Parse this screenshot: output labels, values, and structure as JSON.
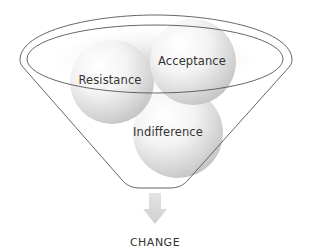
{
  "diagram": {
    "type": "funnel",
    "inputs": [
      {
        "label": "Resistance",
        "position": "left"
      },
      {
        "label": "Acceptance",
        "position": "right"
      },
      {
        "label": "Indifference",
        "position": "bottom"
      }
    ],
    "output": {
      "label": "CHANGE"
    },
    "colors": {
      "outline": "#555555",
      "sphere_light": "#ffffff",
      "sphere_dark": "#c8c8c8",
      "arrow": "#d8d8d8",
      "text": "#333333"
    }
  }
}
